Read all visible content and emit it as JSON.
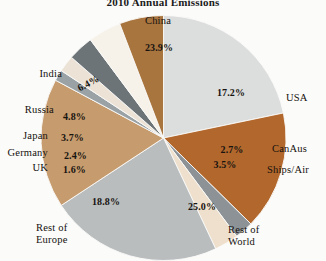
{
  "chart_data": {
    "type": "pie",
    "title": "2010 Annual Emissions",
    "xlabel": "",
    "ylabel": "",
    "legend": "none",
    "grid": false,
    "start_angle_deg": 90,
    "direction": "clockwise",
    "categories": [
      "China",
      "USA",
      "CanAus",
      "Ships/Air",
      "Rest of World",
      "Rest of Europe",
      "UK",
      "Germany",
      "Japan",
      "Russia",
      "India"
    ],
    "values": [
      23.9,
      17.2,
      2.7,
      3.5,
      25.0,
      18.8,
      1.6,
      2.4,
      3.7,
      4.8,
      6.4
    ],
    "value_labels": [
      "23.9%",
      "17.2%",
      "2.7%",
      "3.5%",
      "25.0%",
      "18.8%",
      "1.6%",
      "2.4%",
      "3.7%",
      "4.8%",
      "6.4%"
    ],
    "colors": [
      "#dcdedd",
      "#b2682c",
      "#8c9295",
      "#eee0cc",
      "#b9bdbe",
      "#c69b6d",
      "#9aa2a6",
      "#ece3d6",
      "#6d7478",
      "#f6f2e9",
      "#a9753f"
    ],
    "unit": "%"
  },
  "title": {
    "text": "2010 Annual Emissions"
  },
  "slices": {
    "china": {
      "label": "China",
      "value": "23.9%",
      "color": "#dcdedd"
    },
    "usa": {
      "label": "USA",
      "value": "17.2%",
      "color": "#b2682c"
    },
    "canaus": {
      "label": "CanAus",
      "value": "2.7%",
      "color": "#8c9295"
    },
    "ships_air": {
      "label": "Ships/Air",
      "value": "3.5%",
      "color": "#eee0cc"
    },
    "rest_of_world": {
      "label_line1": "Rest of",
      "label_line2": "World",
      "value": "25.0%",
      "color": "#b9bdbe"
    },
    "rest_of_europe": {
      "label_line1": "Rest of",
      "label_line2": "Europe",
      "value": "18.8%",
      "color": "#c69b6d"
    },
    "uk": {
      "label": "UK",
      "value": "1.6%",
      "color": "#9aa2a6"
    },
    "germany": {
      "label": "Germany",
      "value": "2.4%",
      "color": "#ece3d6"
    },
    "japan": {
      "label": "Japan",
      "value": "3.7%",
      "color": "#6d7478"
    },
    "russia": {
      "label": "Russia",
      "value": "4.8%",
      "color": "#f6f2e9"
    },
    "india": {
      "label": "India",
      "value": "6.4%",
      "color": "#a9753f"
    }
  }
}
